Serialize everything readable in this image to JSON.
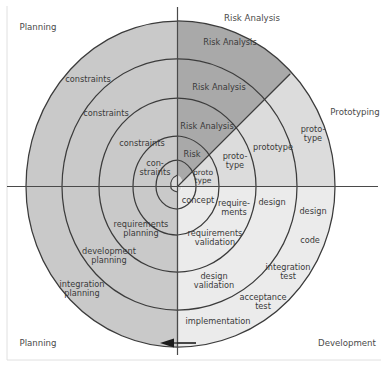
{
  "diagram": {
    "center": {
      "x": 177.5,
      "y": 186.5
    },
    "colors": {
      "planning_quadrant": "#c9c9c9",
      "risk_analysis_sector": "#a9a9a9",
      "prototyping_sector": "#dcdcdc",
      "development_quadrant": "#ebebeb",
      "stroke": "#3b3b3b",
      "axis": "#4a4a4a",
      "text": "#3a3a3a",
      "frame": "#d8d8d8",
      "background": "#ffffff"
    },
    "axes": {
      "vertical": {
        "x": 177.5,
        "y1": 7,
        "y2": 355
      },
      "horizontal": {
        "y": 186.5,
        "x1": 7,
        "x2": 378
      },
      "arrow": {
        "direction": "left",
        "x": 195,
        "y": 343,
        "label": "flow-arrow"
      }
    },
    "spiral": {
      "turns": 4,
      "crossings": {
        "top": [
          21,
          59,
          98,
          136,
          160,
          175
        ],
        "left": [
          26,
          62,
          99,
          133,
          156,
          171
        ],
        "right": [
          335,
          297,
          256,
          219,
          196,
          181
        ],
        "bottom": [
          347,
          310,
          272,
          235,
          209,
          192
        ]
      }
    },
    "quadrant_labels": [
      {
        "name": "planning-top-left",
        "text": "Planning",
        "x": 38,
        "y": 28
      },
      {
        "name": "risk-analysis-top-right",
        "text": "Risk Analysis",
        "x": 252,
        "y": 19
      },
      {
        "name": "prototyping-right",
        "text": "Prototyping",
        "x": 355,
        "y": 113
      },
      {
        "name": "planning-bottom-left",
        "text": "Planning",
        "x": 38,
        "y": 344
      },
      {
        "name": "development-bottom-right",
        "text": "Development",
        "x": 347,
        "y": 344
      }
    ],
    "ring_labels": {
      "planning_quadrant": [
        {
          "text": "constraints",
          "x": 88,
          "y": 80
        },
        {
          "text": "constraints",
          "x": 106,
          "y": 114
        },
        {
          "text": "constraints",
          "x": 142,
          "y": 144
        },
        {
          "text": "con-\nstraints",
          "x": 155,
          "y": 168
        },
        {
          "text": "requirements\nplanning",
          "x": 141,
          "y": 229
        },
        {
          "text": "development\nplanning",
          "x": 109,
          "y": 256
        },
        {
          "text": "integration\nplanning",
          "x": 82,
          "y": 289
        }
      ],
      "risk_analysis_sector": [
        {
          "text": "Risk Analysis",
          "x": 230,
          "y": 43
        },
        {
          "text": "Risk Analysis",
          "x": 219,
          "y": 88
        },
        {
          "text": "Risk Analysis",
          "x": 207,
          "y": 127
        },
        {
          "text": "Risk",
          "x": 192,
          "y": 155
        }
      ],
      "prototyping_sector": [
        {
          "text": "proto-\ntype",
          "x": 313,
          "y": 134
        },
        {
          "text": "prototype",
          "x": 273,
          "y": 148
        },
        {
          "text": "proto-\ntype",
          "x": 235,
          "y": 161
        },
        {
          "text": "proto\ntype",
          "x": 203,
          "y": 177
        }
      ],
      "development_quadrant": [
        {
          "text": "concept",
          "x": 198,
          "y": 201
        },
        {
          "text": "require-\nments",
          "x": 234,
          "y": 208
        },
        {
          "text": "design",
          "x": 272,
          "y": 203
        },
        {
          "text": "design",
          "x": 313,
          "y": 212
        },
        {
          "text": "code",
          "x": 310,
          "y": 241
        },
        {
          "text": "requirements\nvalidation",
          "x": 215,
          "y": 238
        },
        {
          "text": "design\nvalidation",
          "x": 214,
          "y": 281
        },
        {
          "text": "integration\ntest",
          "x": 288,
          "y": 272
        },
        {
          "text": "acceptance\ntest",
          "x": 263,
          "y": 302
        },
        {
          "text": "implementation",
          "x": 218,
          "y": 322
        }
      ]
    }
  }
}
